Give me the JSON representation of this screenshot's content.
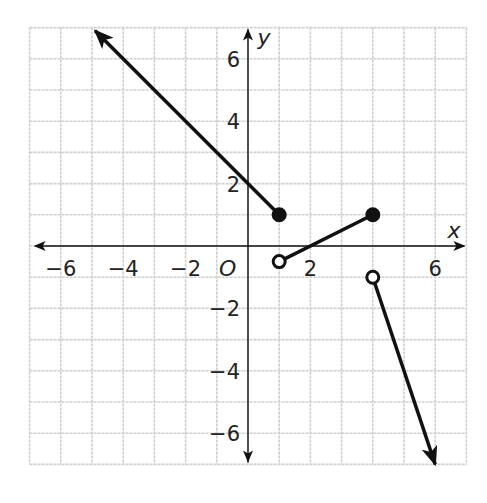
{
  "chart_data": {
    "type": "line",
    "title": "",
    "xlabel": "x",
    "ylabel": "y",
    "origin_label": "O",
    "xlim": [
      -7,
      7
    ],
    "ylim": [
      -7,
      7
    ],
    "grid": true,
    "x_ticks": [
      {
        "value": -6,
        "label": "−6"
      },
      {
        "value": -4,
        "label": "−4"
      },
      {
        "value": -2,
        "label": "−2"
      },
      {
        "value": 2,
        "label": "2"
      },
      {
        "value": 6,
        "label": "6"
      }
    ],
    "y_ticks": [
      {
        "value": 6,
        "label": "6"
      },
      {
        "value": 4,
        "label": "4"
      },
      {
        "value": 2,
        "label": "2"
      },
      {
        "value": -2,
        "label": "−2"
      },
      {
        "value": -4,
        "label": "−4"
      },
      {
        "value": -6,
        "label": "−6"
      }
    ],
    "series": [
      {
        "name": "piece-1",
        "kind": "ray",
        "equation": "y = -x + 2",
        "domain": "x <= 1",
        "start": {
          "x": 1,
          "y": 1,
          "endpoint": "closed"
        },
        "arrow_to": {
          "x": -4.9,
          "y": 6.9
        }
      },
      {
        "name": "piece-2",
        "kind": "segment",
        "equation": "y = 0.5x - 1",
        "domain": "1 < x <= 4",
        "start": {
          "x": 1,
          "y": -0.5,
          "endpoint": "open"
        },
        "end": {
          "x": 4,
          "y": 1,
          "endpoint": "closed"
        }
      },
      {
        "name": "piece-3",
        "kind": "ray",
        "equation": "y = -3x + 11",
        "domain": "x > 4",
        "start": {
          "x": 4,
          "y": -1,
          "endpoint": "open"
        },
        "arrow_to": {
          "x": 6,
          "y": -7
        }
      }
    ]
  }
}
